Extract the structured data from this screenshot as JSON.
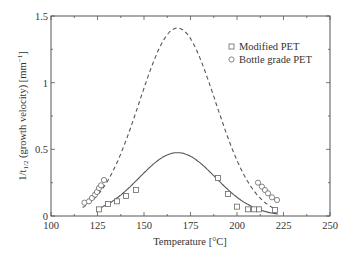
{
  "chart_data": {
    "type": "scatter",
    "title": "",
    "xlabel": "Temperature [°C]",
    "ylabel": "1/t1/2 (growth velocity) [mm-1]",
    "ylabel_parts": {
      "main": "1/t",
      "sub": "1/2",
      "rest": " (growth velocity) [mm",
      "sup": "−1",
      "end": "]"
    },
    "xlim": [
      100,
      250
    ],
    "ylim": [
      0,
      1.5
    ],
    "xticks": [
      100,
      125,
      150,
      175,
      200,
      225,
      250
    ],
    "yticks": [
      0,
      0.5,
      1,
      1.5
    ],
    "ytick_labels": [
      "0",
      "0.5",
      "1",
      "1.5"
    ],
    "grid": false,
    "legend_position": "upper right",
    "legend": [
      {
        "label": "Modified PET",
        "marker": "square"
      },
      {
        "label": "Bottle grade PET",
        "marker": "circle"
      }
    ],
    "series": [
      {
        "name": "Modified PET",
        "marker": "square",
        "x": [
          125.8,
          130.6,
          135.5,
          140.3,
          145.7,
          189.8,
          195.2,
          200.0,
          205.9,
          209.1,
          211.8,
          220.4
        ],
        "y": [
          0.05,
          0.09,
          0.11,
          0.15,
          0.195,
          0.285,
          0.165,
          0.07,
          0.05,
          0.05,
          0.05,
          0.045
        ]
      },
      {
        "name": "Bottle grade PET",
        "marker": "circle",
        "x": [
          118.0,
          120.4,
          122.0,
          123.7,
          124.7,
          125.8,
          126.9,
          128.5,
          211.3,
          213.4,
          215.0,
          216.7,
          218.8,
          221.5
        ],
        "y": [
          0.1,
          0.11,
          0.135,
          0.16,
          0.18,
          0.21,
          0.23,
          0.27,
          0.25,
          0.22,
          0.195,
          0.17,
          0.14,
          0.12
        ]
      },
      {
        "name": "Modified PET fit",
        "style": "solid",
        "model": "gaussian",
        "peak_x": 168,
        "peak_y": 0.475,
        "sigma": 20.5,
        "x_range": [
          125,
          222
        ]
      },
      {
        "name": "Bottle grade PET fit",
        "style": "dashed",
        "model": "gaussian",
        "peak_x": 168,
        "peak_y": 1.41,
        "sigma": 20.5,
        "x_range": [
          117,
          222
        ]
      }
    ]
  }
}
